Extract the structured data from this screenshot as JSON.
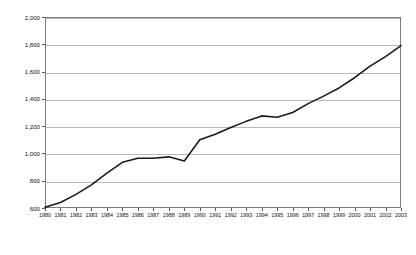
{
  "chart_data": {
    "type": "line",
    "title": "",
    "subtitle": "",
    "xlabel": "",
    "ylabel": "Thousand barrels per day",
    "x": [
      1980,
      1981,
      1982,
      1983,
      1984,
      1985,
      1986,
      1987,
      1988,
      1989,
      1990,
      1991,
      1992,
      1993,
      1994,
      1995,
      1996,
      1997,
      1998,
      1999,
      2000,
      2001,
      2002,
      2003
    ],
    "categories": [
      "1980",
      "1981",
      "1982",
      "1983",
      "1984",
      "1985",
      "1986",
      "1987",
      "1988",
      "1989",
      "1990",
      "1991",
      "1992",
      "1993",
      "1994",
      "1995",
      "1996",
      "1997",
      "1998",
      "1999",
      "2000",
      "2001",
      "2002",
      "2003"
    ],
    "series": [
      {
        "name": "Thousand barrels per day",
        "color": "#1a1a1a",
        "values": [
          605,
          640,
          700,
          770,
          855,
          935,
          965,
          965,
          975,
          945,
          1100,
          1140,
          1190,
          1235,
          1275,
          1265,
          1300,
          1365,
          1420,
          1480,
          1555,
          1640,
          1710,
          1790
        ]
      }
    ],
    "ylim": [
      600,
      2000
    ],
    "ytick_values": [
      600,
      800,
      1000,
      1200,
      1400,
      1600,
      1800,
      2000
    ],
    "ytick_labels": [
      "600",
      "800",
      "1,000",
      "1,200",
      "1,400",
      "1,600",
      "1,800",
      "2,000"
    ],
    "xlim": [
      1980,
      2003
    ],
    "grid": {
      "horizontal": true,
      "vertical": false
    },
    "legend": {
      "visible": false,
      "position": "none"
    },
    "markers": false,
    "line_width": 1.6,
    "plot_border_color": "#7d7d7d",
    "gridline_color": "#b9b9b9",
    "background_color": "#ffffff"
  }
}
